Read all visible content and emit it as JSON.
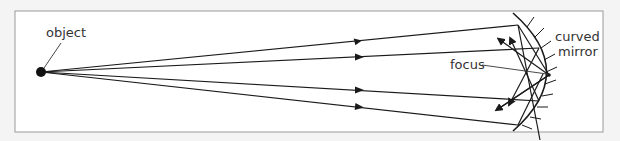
{
  "diagram": {
    "labels": {
      "object": "object",
      "focus": "focus",
      "mirror_line1": "curved",
      "mirror_line2": "mirror"
    },
    "colors": {
      "background": "#f4f4f4",
      "panel": "#ffffff",
      "frame": "#9a9a9a",
      "ink": "#1a1a1a",
      "label": "#333333"
    },
    "object_point": {
      "x": 41,
      "y": 72
    },
    "focus_point": {
      "x": 549,
      "y": 75
    },
    "incident_rays": [
      {
        "name": "ray-1",
        "mirror_hit": {
          "x": 518,
          "y": 25
        }
      },
      {
        "name": "ray-2",
        "mirror_hit": {
          "x": 539,
          "y": 48
        }
      },
      {
        "name": "ray-3",
        "mirror_hit": {
          "x": 539,
          "y": 101
        }
      },
      {
        "name": "ray-4",
        "mirror_hit": {
          "x": 518,
          "y": 125
        }
      }
    ],
    "reflected_rays_count": 4,
    "mirror": "concave, hatched on convex side"
  }
}
